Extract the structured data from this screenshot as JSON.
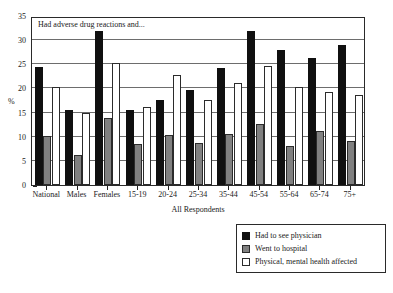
{
  "chart_data": {
    "type": "bar",
    "title": "",
    "annotation": "Had adverse drug reactions and...",
    "xlabel": "All Respondents",
    "ylabel": "%",
    "ylim": [
      0,
      35
    ],
    "yticks": [
      0,
      5,
      10,
      15,
      20,
      25,
      30,
      35
    ],
    "grid": true,
    "legend_position": "bottom-right",
    "categories": [
      "National",
      "Males",
      "Females",
      "15-19",
      "20-24",
      "25-34",
      "35-44",
      "45-54",
      "55-64",
      "65-74",
      "75+"
    ],
    "series": [
      {
        "name": "Had to see physician",
        "color": "#101010",
        "values": [
          24.4,
          15.6,
          31.8,
          15.6,
          17.6,
          19.7,
          24.3,
          32.0,
          28.0,
          26.4,
          29.1
        ]
      },
      {
        "name": "Went to hospital",
        "color": "#808080",
        "values": [
          10.2,
          6.3,
          13.8,
          8.4,
          10.4,
          8.8,
          10.6,
          12.6,
          8.0,
          11.2,
          9.2
        ]
      },
      {
        "name": "Physical, mental health affected",
        "color": "#ffffff",
        "values": [
          20.4,
          15.0,
          25.3,
          16.2,
          22.8,
          17.7,
          21.2,
          24.6,
          20.4,
          19.3,
          18.7
        ]
      }
    ]
  },
  "legend": {
    "items": [
      {
        "label": "Had to see physician",
        "swatch": "black-square-swatch"
      },
      {
        "label": "Went to hospital",
        "swatch": "gray-square-swatch"
      },
      {
        "label": "Physical, mental health affected",
        "swatch": "white-square-swatch"
      }
    ]
  }
}
